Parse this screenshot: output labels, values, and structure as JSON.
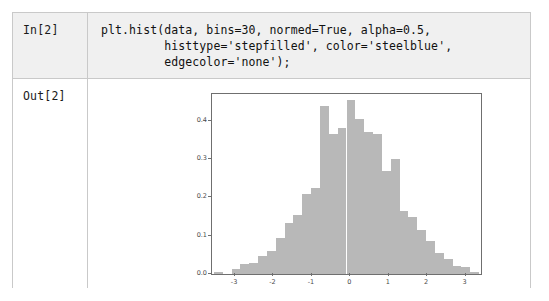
{
  "cells": {
    "input": {
      "prompt": "In[2]",
      "source": "plt.hist(data, bins=30, normed=True, alpha=0.5,\n         histtype='stepfilled', color='steelblue',\n         edgecolor='none');"
    },
    "output": {
      "prompt": "Out[2]"
    }
  },
  "colors": {
    "bar_fill": "#b8b8b8",
    "axis_line": "#6f6f6f",
    "input_cell_background": "#f0f0f0",
    "table_border": "#c9c9c9",
    "text": "#111111"
  },
  "chart_data": {
    "type": "bar",
    "title": "",
    "xlabel": "",
    "ylabel": "",
    "xlim": [
      -3.6,
      3.4
    ],
    "ylim": [
      0.0,
      0.47
    ],
    "xticks": [
      -3,
      -2,
      -1,
      0,
      1,
      2,
      3
    ],
    "xtick_labels": [
      "-3",
      "-2",
      "-1",
      "0",
      "1",
      "2",
      "3"
    ],
    "yticks": [
      0.0,
      0.1,
      0.2,
      0.3,
      0.4
    ],
    "ytick_labels": [
      "0.0",
      "0.1",
      "0.2",
      "0.3",
      "0.4"
    ],
    "grid": false,
    "legend": null,
    "bins": 30,
    "normed": true,
    "alpha": 0.5,
    "histtype": "stepfilled",
    "color": "steelblue",
    "edgecolor": "none",
    "bin_edges": [
      -3.55,
      -3.32,
      -3.09,
      -2.86,
      -2.63,
      -2.4,
      -2.17,
      -1.94,
      -1.71,
      -1.48,
      -1.25,
      -1.02,
      -0.79,
      -0.56,
      -0.33,
      -0.1,
      0.13,
      0.36,
      0.59,
      0.82,
      1.05,
      1.28,
      1.51,
      1.74,
      1.97,
      2.2,
      2.43,
      2.66,
      2.89,
      3.12,
      3.35
    ],
    "bin_centers": [
      -3.435,
      -3.205,
      -2.975,
      -2.745,
      -2.515,
      -2.285,
      -2.055,
      -1.825,
      -1.595,
      -1.365,
      -1.135,
      -0.905,
      -0.675,
      -0.445,
      -0.215,
      0.015,
      0.245,
      0.475,
      0.705,
      0.935,
      1.165,
      1.395,
      1.625,
      1.855,
      2.085,
      2.315,
      2.545,
      2.775,
      3.005,
      3.235
    ],
    "values": [
      0.005,
      0.0,
      0.012,
      0.025,
      0.028,
      0.046,
      0.06,
      0.095,
      0.133,
      0.155,
      0.21,
      0.225,
      0.44,
      0.365,
      0.38,
      0.455,
      0.405,
      0.37,
      0.365,
      0.27,
      0.3,
      0.165,
      0.15,
      0.115,
      0.085,
      0.055,
      0.04,
      0.022,
      0.018,
      0.005
    ]
  }
}
